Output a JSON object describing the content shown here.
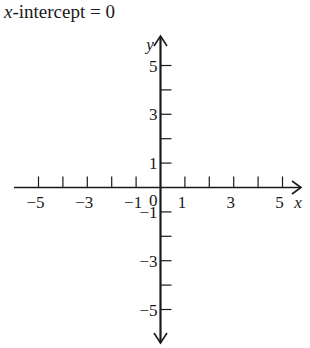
{
  "title": {
    "variable": "x",
    "rest": "-intercept = 0"
  },
  "chart_data": {
    "type": "line",
    "title": "x-intercept = 0",
    "xlabel": "x",
    "ylabel": "y",
    "xlim": [
      -6,
      6
    ],
    "ylim": [
      -6,
      6
    ],
    "x_ticks": [
      -5,
      -4,
      -3,
      -2,
      -1,
      1,
      2,
      3,
      4,
      5
    ],
    "x_tick_labels": [
      "-5",
      "-3",
      "-1",
      "0",
      "1",
      "3",
      "5"
    ],
    "y_ticks": [
      -5,
      -4,
      -3,
      -2,
      -1,
      1,
      2,
      3,
      4,
      5
    ],
    "y_tick_labels": [
      "5",
      "3",
      "1",
      "-1",
      "-3",
      "-5"
    ],
    "grid": false,
    "series": [],
    "annotations": [
      "x-intercept = 0"
    ]
  },
  "axes": {
    "x_label": "x",
    "y_label": "y",
    "origin_label": "0",
    "x_labels": [
      {
        "text": "−5",
        "v": -5
      },
      {
        "text": "−3",
        "v": -3
      },
      {
        "text": "−1",
        "v": -1
      },
      {
        "text": "1",
        "v": 1
      },
      {
        "text": "3",
        "v": 3
      },
      {
        "text": "5",
        "v": 5
      }
    ],
    "y_labels": [
      {
        "text": "5",
        "v": 5
      },
      {
        "text": "3",
        "v": 3
      },
      {
        "text": "1",
        "v": 1
      },
      {
        "text": "−1",
        "v": -1
      },
      {
        "text": "−3",
        "v": -3
      },
      {
        "text": "−5",
        "v": -5
      }
    ]
  }
}
